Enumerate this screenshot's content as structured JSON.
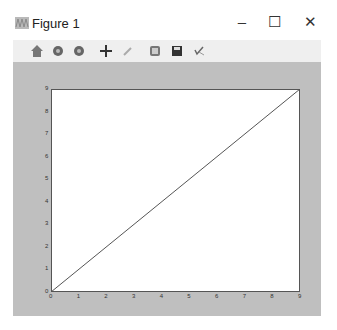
{
  "window": {
    "title": "Figure 1",
    "icon": "matplotlib-icon",
    "controls": {
      "minimize": "–",
      "maximize": "☐",
      "close": "✕"
    }
  },
  "toolbar": {
    "buttons": [
      {
        "name": "home",
        "icon": "home-icon"
      },
      {
        "name": "back",
        "icon": "back-icon"
      },
      {
        "name": "forward",
        "icon": "forward-icon"
      },
      {
        "name": "pan",
        "icon": "pan-icon"
      },
      {
        "name": "zoom",
        "icon": "zoom-rect-icon"
      },
      {
        "name": "subplots",
        "icon": "subplots-icon"
      },
      {
        "name": "save",
        "icon": "save-icon"
      },
      {
        "name": "edit",
        "icon": "edit-icon"
      }
    ]
  },
  "chart_data": {
    "type": "line",
    "title": "",
    "xlabel": "",
    "ylabel": "",
    "x": [
      0,
      1,
      2,
      3,
      4,
      5,
      6,
      7,
      8,
      9
    ],
    "series": [
      {
        "name": "",
        "values": [
          0,
          1,
          2,
          3,
          4,
          5,
          6,
          7,
          8,
          9
        ]
      }
    ],
    "xlim": [
      0,
      9
    ],
    "ylim": [
      0,
      9
    ],
    "xticks": [
      "0",
      "1",
      "2",
      "3",
      "4",
      "5",
      "6",
      "7",
      "8",
      "9"
    ],
    "yticks": [
      "0",
      "1",
      "2",
      "3",
      "4",
      "5",
      "6",
      "7",
      "8",
      "9"
    ],
    "grid": false,
    "line_color": "#555555"
  }
}
